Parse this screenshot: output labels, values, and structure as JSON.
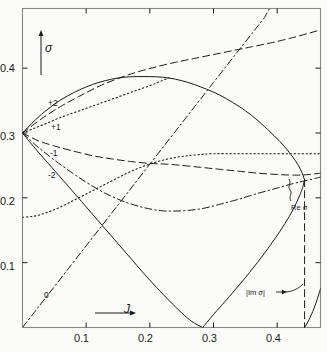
{
  "figure": {
    "background_color": "#fbfbf9",
    "ink_color": "#1a1a1a"
  },
  "chart_data": {
    "type": "line",
    "title": "",
    "xlabel": "J",
    "ylabel": "σ",
    "xlim": [
      0.0,
      0.468
    ],
    "ylim": [
      0.0,
      0.492
    ],
    "xticks": [
      0.1,
      0.2,
      0.3,
      0.4
    ],
    "xtick_labels": [
      "0.1",
      "0.2",
      "0.3",
      "0.4"
    ],
    "yticks": [
      0.1,
      0.2,
      0.3,
      0.4
    ],
    "ytick_labels": [
      "0.1",
      "0.2",
      "0.3",
      "0.4"
    ],
    "grid": false,
    "legend": "none",
    "branch_point": {
      "J": 0.0,
      "sigma": 0.3
    },
    "cusp_point": {
      "J": 0.283,
      "sigma": 0.0
    },
    "critical_J": 0.443,
    "annotations": [
      {
        "text": "+2",
        "J": 0.038,
        "sigma": 0.333,
        "role": "branch-label"
      },
      {
        "text": "+1",
        "J": 0.042,
        "sigma": 0.308,
        "role": "branch-label"
      },
      {
        "text": "-1",
        "J": 0.04,
        "sigma": 0.276,
        "role": "branch-label"
      },
      {
        "text": "-2",
        "J": 0.038,
        "sigma": 0.252,
        "role": "branch-label"
      },
      {
        "text": "0",
        "J": 0.03,
        "sigma": 0.037,
        "role": "branch-label"
      },
      {
        "text": "Re σ",
        "J": 0.42,
        "sigma": 0.194,
        "role": "curve-annotation"
      },
      {
        "text": "|Im σ|",
        "J": 0.355,
        "sigma": 0.055,
        "role": "curve-annotation"
      }
    ],
    "series": [
      {
        "name": "upper-solid-envelope",
        "style": "solid",
        "points": [
          [
            0.0,
            0.3
          ],
          [
            0.02,
            0.32
          ],
          [
            0.04,
            0.337
          ],
          [
            0.06,
            0.351
          ],
          [
            0.08,
            0.362
          ],
          [
            0.1,
            0.371
          ],
          [
            0.12,
            0.378
          ],
          [
            0.14,
            0.383
          ],
          [
            0.16,
            0.386
          ],
          [
            0.18,
            0.387
          ],
          [
            0.2,
            0.387
          ],
          [
            0.22,
            0.386
          ],
          [
            0.24,
            0.383
          ],
          [
            0.26,
            0.378
          ],
          [
            0.28,
            0.371
          ],
          [
            0.3,
            0.363
          ],
          [
            0.32,
            0.353
          ],
          [
            0.34,
            0.341
          ],
          [
            0.36,
            0.327
          ],
          [
            0.38,
            0.31
          ],
          [
            0.4,
            0.291
          ],
          [
            0.415,
            0.275
          ],
          [
            0.428,
            0.258
          ],
          [
            0.437,
            0.243
          ],
          [
            0.443,
            0.228
          ]
        ]
      },
      {
        "name": "lower-solid-envelope",
        "style": "solid",
        "points": [
          [
            0.0,
            0.3
          ],
          [
            0.02,
            0.276
          ],
          [
            0.045,
            0.248
          ],
          [
            0.07,
            0.22
          ],
          [
            0.1,
            0.186
          ],
          [
            0.13,
            0.152
          ],
          [
            0.16,
            0.118
          ],
          [
            0.2,
            0.073
          ],
          [
            0.24,
            0.032
          ],
          [
            0.265,
            0.01
          ],
          [
            0.283,
            0.0
          ]
        ]
      },
      {
        "name": "solid-rising-from-cusp",
        "style": "solid",
        "points": [
          [
            0.283,
            0.0
          ],
          [
            0.3,
            0.02
          ],
          [
            0.325,
            0.048
          ],
          [
            0.35,
            0.077
          ],
          [
            0.375,
            0.108
          ],
          [
            0.395,
            0.135
          ],
          [
            0.412,
            0.16
          ],
          [
            0.425,
            0.182
          ],
          [
            0.435,
            0.203
          ],
          [
            0.44,
            0.216
          ],
          [
            0.443,
            0.228
          ]
        ]
      },
      {
        "name": "dashed-plus2",
        "style": "dashed",
        "points": [
          [
            0.0,
            0.3
          ],
          [
            0.03,
            0.322
          ],
          [
            0.06,
            0.341
          ],
          [
            0.09,
            0.357
          ],
          [
            0.12,
            0.372
          ],
          [
            0.15,
            0.384
          ],
          [
            0.18,
            0.394
          ],
          [
            0.21,
            0.402
          ],
          [
            0.24,
            0.409
          ],
          [
            0.27,
            0.415
          ],
          [
            0.3,
            0.421
          ],
          [
            0.33,
            0.427
          ],
          [
            0.36,
            0.433
          ],
          [
            0.39,
            0.439
          ],
          [
            0.42,
            0.446
          ],
          [
            0.45,
            0.454
          ],
          [
            0.468,
            0.459
          ]
        ]
      },
      {
        "name": "dotted-plus1",
        "style": "dotted",
        "points": [
          [
            0.0,
            0.3
          ],
          [
            0.02,
            0.308
          ],
          [
            0.04,
            0.316
          ],
          [
            0.06,
            0.324
          ],
          [
            0.08,
            0.331
          ],
          [
            0.1,
            0.338
          ],
          [
            0.12,
            0.345
          ],
          [
            0.14,
            0.352
          ],
          [
            0.16,
            0.359
          ],
          [
            0.18,
            0.366
          ],
          [
            0.2,
            0.373
          ],
          [
            0.215,
            0.379
          ],
          [
            0.23,
            0.385
          ]
        ]
      },
      {
        "name": "dashed-minus1",
        "style": "dashed",
        "points": [
          [
            0.0,
            0.3
          ],
          [
            0.025,
            0.288
          ],
          [
            0.05,
            0.28
          ],
          [
            0.08,
            0.272
          ],
          [
            0.11,
            0.265
          ],
          [
            0.14,
            0.26
          ],
          [
            0.17,
            0.256
          ],
          [
            0.2,
            0.253
          ],
          [
            0.225,
            0.252
          ],
          [
            0.25,
            0.25
          ],
          [
            0.28,
            0.247
          ],
          [
            0.31,
            0.244
          ],
          [
            0.34,
            0.241
          ],
          [
            0.37,
            0.238
          ],
          [
            0.4,
            0.236
          ],
          [
            0.43,
            0.235
          ],
          [
            0.45,
            0.236
          ],
          [
            0.468,
            0.238
          ]
        ]
      },
      {
        "name": "dotted-plateau",
        "style": "dotted",
        "points": [
          [
            0.0,
            0.17
          ],
          [
            0.02,
            0.172
          ],
          [
            0.04,
            0.178
          ],
          [
            0.06,
            0.186
          ],
          [
            0.08,
            0.196
          ],
          [
            0.1,
            0.206
          ],
          [
            0.12,
            0.216
          ],
          [
            0.14,
            0.226
          ],
          [
            0.16,
            0.236
          ],
          [
            0.18,
            0.245
          ],
          [
            0.2,
            0.252
          ],
          [
            0.22,
            0.258
          ],
          [
            0.245,
            0.263
          ],
          [
            0.27,
            0.266
          ],
          [
            0.3,
            0.268
          ],
          [
            0.34,
            0.268
          ],
          [
            0.38,
            0.268
          ],
          [
            0.42,
            0.268
          ],
          [
            0.45,
            0.268
          ],
          [
            0.468,
            0.268
          ]
        ]
      },
      {
        "name": "dashdot-minus2-lower",
        "style": "dashdot",
        "points": [
          [
            0.0,
            0.3
          ],
          [
            0.02,
            0.282
          ],
          [
            0.045,
            0.262
          ],
          [
            0.07,
            0.244
          ],
          [
            0.1,
            0.224
          ],
          [
            0.13,
            0.207
          ],
          [
            0.16,
            0.194
          ],
          [
            0.19,
            0.185
          ],
          [
            0.22,
            0.18
          ],
          [
            0.25,
            0.18
          ],
          [
            0.28,
            0.183
          ],
          [
            0.31,
            0.19
          ],
          [
            0.34,
            0.198
          ],
          [
            0.37,
            0.207
          ],
          [
            0.4,
            0.215
          ],
          [
            0.425,
            0.222
          ],
          [
            0.443,
            0.226
          ],
          [
            0.46,
            0.23
          ],
          [
            0.468,
            0.232
          ]
        ]
      },
      {
        "name": "dashdot-zero-line",
        "style": "dashdot",
        "points": [
          [
            0.0,
            0.0
          ],
          [
            0.05,
            0.063
          ],
          [
            0.1,
            0.126
          ],
          [
            0.15,
            0.189
          ],
          [
            0.2,
            0.252
          ],
          [
            0.25,
            0.315
          ],
          [
            0.3,
            0.378
          ],
          [
            0.34,
            0.428
          ],
          [
            0.372,
            0.468
          ],
          [
            0.38,
            0.478
          ],
          [
            0.388,
            0.492
          ]
        ]
      },
      {
        "name": "vertical-critical-dashed",
        "style": "dashed",
        "points": [
          [
            0.443,
            0.228
          ],
          [
            0.443,
            0.15
          ],
          [
            0.443,
            0.075
          ],
          [
            0.443,
            0.01
          ],
          [
            0.443,
            0.0
          ]
        ]
      },
      {
        "name": "corner-arc-bottom-right",
        "style": "solid",
        "points": [
          [
            0.443,
            0.0
          ],
          [
            0.45,
            0.012
          ],
          [
            0.456,
            0.025
          ],
          [
            0.461,
            0.038
          ],
          [
            0.465,
            0.05
          ],
          [
            0.468,
            0.06
          ]
        ]
      }
    ]
  }
}
